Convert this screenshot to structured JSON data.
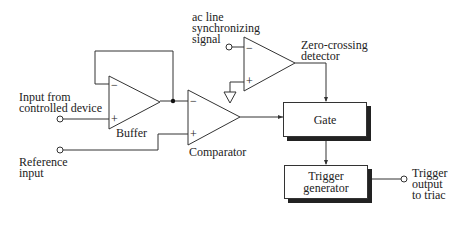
{
  "diagram": {
    "type": "block-schematic",
    "labels": {
      "ac_line": [
        "ac line",
        "synchronizing",
        "signal"
      ],
      "zero_crossing": [
        "Zero-crossing",
        "detector"
      ],
      "input_from": [
        "Input from",
        "controlled device"
      ],
      "buffer": "Buffer",
      "comparator": "Comparator",
      "reference": [
        "Reference",
        "input"
      ],
      "trigger_output": [
        "Trigger",
        "output",
        "to triac"
      ]
    },
    "blocks": {
      "gate": "Gate",
      "trigger_generator": [
        "Trigger",
        "generator"
      ]
    },
    "opamp_signs": {
      "minus": "−",
      "plus": "+"
    },
    "colors": {
      "line": "#333333",
      "shadow": "#222222",
      "background": "#ffffff"
    }
  }
}
